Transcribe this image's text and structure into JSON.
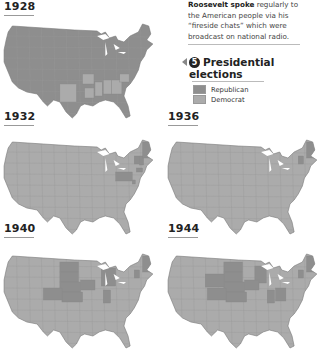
{
  "caption": {
    "bold": "Roosevelt spoke",
    "text": " regularly to the American people via his “fireside chats” which were broadcast on national radio."
  },
  "legend": {
    "number": "5",
    "title_line1": "Presidential",
    "title_line2": "elections",
    "items": [
      {
        "label": "Republican",
        "color": "#8e8e8e"
      },
      {
        "label": "Democrat",
        "color": "#ababab"
      }
    ]
  },
  "colors": {
    "republican": "#8e8e8e",
    "democrat": "#ababab",
    "border": "#7a7a7a",
    "water": "#ffffff"
  },
  "maps": [
    {
      "year": "1928",
      "winner_majority": "republican",
      "democrat_states": [
        "TX-SE",
        "LA",
        "MS",
        "AL",
        "GA",
        "SC",
        "AR"
      ]
    },
    {
      "year": "1932",
      "winner_majority": "democrat",
      "republican_states": [
        "PA",
        "VT",
        "NH",
        "ME",
        "CT",
        "DE"
      ]
    },
    {
      "year": "1936",
      "winner_majority": "democrat",
      "republican_states": [
        "ME",
        "VT"
      ]
    },
    {
      "year": "1940",
      "winner_majority": "democrat",
      "republican_states": [
        "ME",
        "VT",
        "MI",
        "IN",
        "ND",
        "SD",
        "NE",
        "KS",
        "IA",
        "CO"
      ]
    },
    {
      "year": "1944",
      "winner_majority": "democrat",
      "republican_states": [
        "ME",
        "VT",
        "OH",
        "IN",
        "WI",
        "ND",
        "SD",
        "NE",
        "KS",
        "IA",
        "CO",
        "WY"
      ]
    }
  ]
}
